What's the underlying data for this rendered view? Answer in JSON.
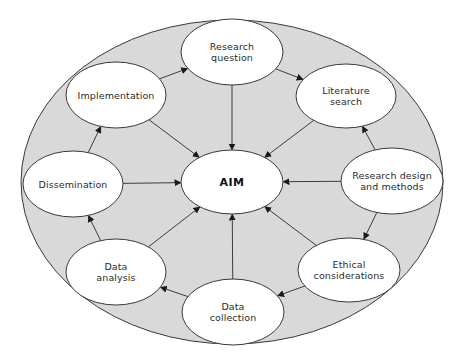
{
  "diagram": {
    "title": "",
    "colors": {
      "background": "#ffffff",
      "outer_fill": "#d9d9d9",
      "node_fill": "#ffffff",
      "stroke": "#3a3a3a"
    },
    "outer": {
      "cx": 232,
      "cy": 182,
      "rx": 211,
      "ry": 162
    },
    "center": {
      "id": "aim",
      "lines": [
        "AIM"
      ],
      "cx": 232,
      "cy": 182,
      "rx": 51,
      "ry": 32
    },
    "nodes": [
      {
        "id": "research-question",
        "lines": [
          "Research",
          "question"
        ],
        "cx": 232,
        "cy": 52,
        "rx": 51,
        "ry": 33
      },
      {
        "id": "literature-search",
        "lines": [
          "Literature",
          "search"
        ],
        "cx": 346,
        "cy": 96,
        "rx": 50,
        "ry": 32
      },
      {
        "id": "research-design",
        "lines": [
          "Research design",
          "and methods"
        ],
        "cx": 392,
        "cy": 181,
        "rx": 51,
        "ry": 33
      },
      {
        "id": "ethical-considerations",
        "lines": [
          "Ethical",
          "considerations"
        ],
        "cx": 349,
        "cy": 270,
        "rx": 51,
        "ry": 32
      },
      {
        "id": "data-collection",
        "lines": [
          "Data",
          "collection"
        ],
        "cx": 233,
        "cy": 312,
        "rx": 51,
        "ry": 33
      },
      {
        "id": "data-analysis",
        "lines": [
          "Data",
          "analysis"
        ],
        "cx": 116,
        "cy": 272,
        "rx": 50,
        "ry": 33
      },
      {
        "id": "dissemination",
        "lines": [
          "Dissemination"
        ],
        "cx": 73,
        "cy": 184,
        "rx": 50,
        "ry": 33
      },
      {
        "id": "implementation",
        "lines": [
          "Implementation"
        ],
        "cx": 116,
        "cy": 95,
        "rx": 50,
        "ry": 33
      }
    ],
    "cycle_edges": [
      {
        "from": "research-question",
        "to": "literature-search"
      },
      {
        "from": "research-design",
        "to": "literature-search"
      },
      {
        "from": "research-design",
        "to": "ethical-considerations"
      },
      {
        "from": "ethical-considerations",
        "to": "data-collection"
      },
      {
        "from": "data-collection",
        "to": "data-analysis"
      },
      {
        "from": "data-analysis",
        "to": "dissemination"
      },
      {
        "from": "dissemination",
        "to": "implementation"
      },
      {
        "from": "implementation",
        "to": "research-question"
      }
    ],
    "center_edges": [
      {
        "from": "research-question",
        "to": "aim"
      },
      {
        "from": "literature-search",
        "to": "aim"
      },
      {
        "from": "research-design",
        "to": "aim"
      },
      {
        "from": "ethical-considerations",
        "to": "aim"
      },
      {
        "from": "data-collection",
        "to": "aim"
      },
      {
        "from": "data-analysis",
        "to": "aim"
      },
      {
        "from": "dissemination",
        "to": "aim"
      },
      {
        "from": "implementation",
        "to": "aim"
      }
    ]
  }
}
